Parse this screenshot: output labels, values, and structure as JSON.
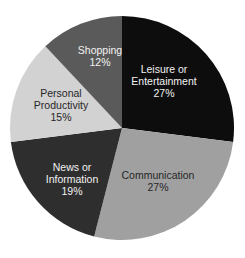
{
  "chart_data": {
    "type": "pie",
    "title": "",
    "subtitle": "",
    "xlabel": "",
    "ylabel": "",
    "legend_position": "none",
    "grid": false,
    "start_angle_deg": 0,
    "direction": "clockwise",
    "units": "percent",
    "categories": [
      "Leisure or Entertainment",
      "Communication",
      "News or Information",
      "Personal Productivity",
      "Shopping"
    ],
    "values": [
      27,
      27,
      19,
      15,
      12
    ],
    "value_labels": [
      "27%",
      "27%",
      "19%",
      "15%",
      "12%"
    ],
    "colors": [
      "#0d0d0d",
      "#a0a0a0",
      "#2e2e2e",
      "#d2d2d2",
      "#5a5a5a"
    ],
    "slices": [
      {
        "name": "Leisure or Entertainment",
        "value": 27,
        "value_label": "27%",
        "color": "#0d0d0d",
        "label_color": "#f2f2f2",
        "label_lines": [
          "Leisure or",
          "Entertainment"
        ],
        "start_deg": 0,
        "end_deg": 97.2,
        "label_x": 164,
        "label_y": 82
      },
      {
        "name": "Communication",
        "value": 27,
        "value_label": "27%",
        "color": "#a0a0a0",
        "label_color": "#262626",
        "label_lines": [
          "Communication"
        ],
        "start_deg": 97.2,
        "end_deg": 194.4,
        "label_x": 158,
        "label_y": 182
      },
      {
        "name": "News or Information",
        "value": 19,
        "value_label": "19%",
        "color": "#2e2e2e",
        "label_color": "#f2f2f2",
        "label_lines": [
          "News or",
          "Information"
        ],
        "start_deg": 194.4,
        "end_deg": 262.8,
        "label_x": 72,
        "label_y": 180
      },
      {
        "name": "Personal Productivity",
        "value": 15,
        "value_label": "15%",
        "color": "#d2d2d2",
        "label_color": "#262626",
        "label_lines": [
          "Personal",
          "Productivity"
        ],
        "start_deg": 262.8,
        "end_deg": 316.8,
        "label_x": 61,
        "label_y": 106
      },
      {
        "name": "Shopping",
        "value": 12,
        "value_label": "12%",
        "color": "#5a5a5a",
        "label_color": "#f2f2f2",
        "label_lines": [
          "Shopping"
        ],
        "start_deg": 316.8,
        "end_deg": 360,
        "label_x": 100,
        "label_y": 57
      }
    ],
    "geometry": {
      "center_x": 122,
      "center_y": 128,
      "radius": 112
    },
    "background_color": "#ffffff"
  }
}
